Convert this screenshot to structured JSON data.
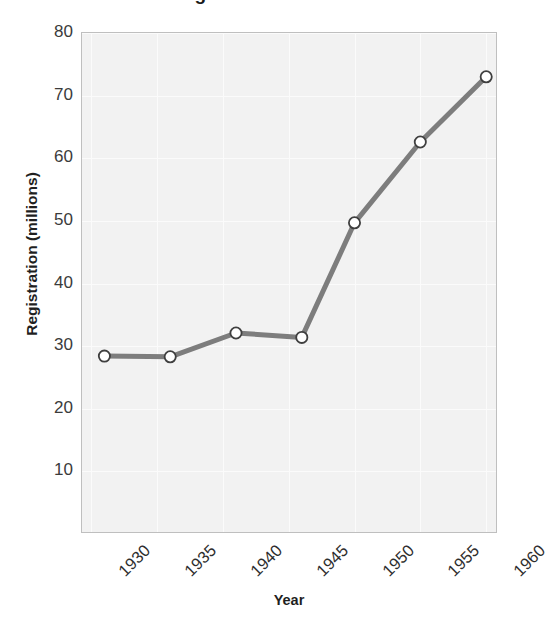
{
  "chart_data": {
    "type": "line",
    "title": "Motor Vehicle Registration in the United States",
    "xlabel": "Year",
    "ylabel": "Registration (millions)",
    "x": [
      1931,
      1936,
      1941,
      1946,
      1950,
      1955,
      1960
    ],
    "values": [
      28.4,
      28.3,
      32.1,
      31.4,
      49.7,
      62.6,
      73.0
    ],
    "series": [
      {
        "name": "Registration",
        "values": [
          28.4,
          28.3,
          32.1,
          31.4,
          49.7,
          62.6,
          73.0
        ]
      }
    ],
    "x_tick_labels": [
      "1930",
      "1935",
      "1940",
      "1945",
      "1950",
      "1955",
      "1960"
    ],
    "x_tick_values": [
      1930,
      1935,
      1940,
      1945,
      1950,
      1955,
      1960
    ],
    "y_tick_labels": [
      "10",
      "20",
      "30",
      "40",
      "50",
      "60",
      "70",
      "80"
    ],
    "y_tick_values": [
      10,
      20,
      30,
      40,
      50,
      60,
      70,
      80
    ],
    "xlim": [
      1929.3,
      1960.9
    ],
    "ylim": [
      0,
      80
    ],
    "grid": true,
    "legend": "none",
    "marker": "circle-open",
    "line_color": "#7d7d7d",
    "marker_face_color": "#ffffff",
    "marker_edge_color": "#3f3f3f",
    "plot_background": "#f2f2f2",
    "grid_color": "#fbfbfb",
    "axis_border_color": "#bfbfbf"
  }
}
